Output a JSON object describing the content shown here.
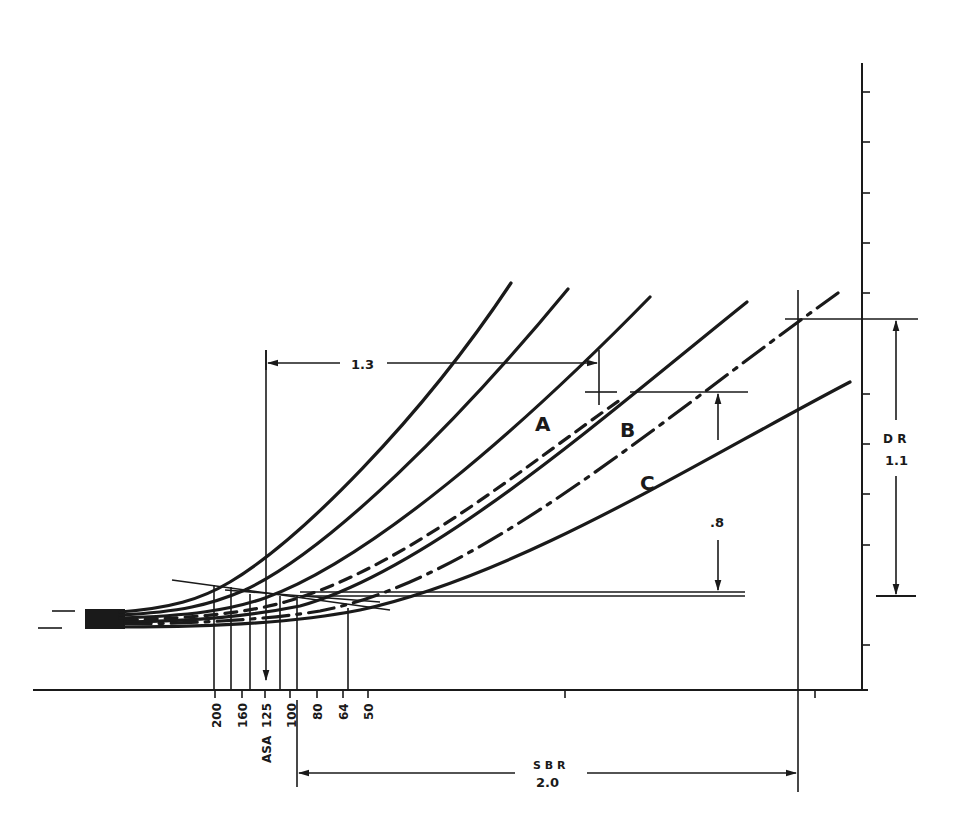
{
  "diagram": {
    "type": "characteristic-curves",
    "curve_labels": {
      "a": "A",
      "b": "B",
      "c": "C"
    },
    "dimensions": {
      "horizontal_top": "1.3",
      "vertical_mid": ".8",
      "dr_label": "D R",
      "dr_value": "1.1",
      "sbr_label": "S B R",
      "sbr_value": "2.0"
    },
    "asa_axis": {
      "label": "ASA",
      "ticks": [
        "200",
        "160",
        "125",
        "100",
        "80",
        "64",
        "50"
      ]
    },
    "colors": {
      "ink": "#1a1a1a",
      "paper": "#ffffff"
    }
  }
}
